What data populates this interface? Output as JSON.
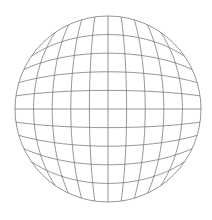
{
  "figure": {
    "background_color": "#ffffff",
    "line_color": "#7a7a7a",
    "line_width": 0.8,
    "grid_divisions": 10,
    "center": [
      108,
      109
    ],
    "radius": 93
  }
}
